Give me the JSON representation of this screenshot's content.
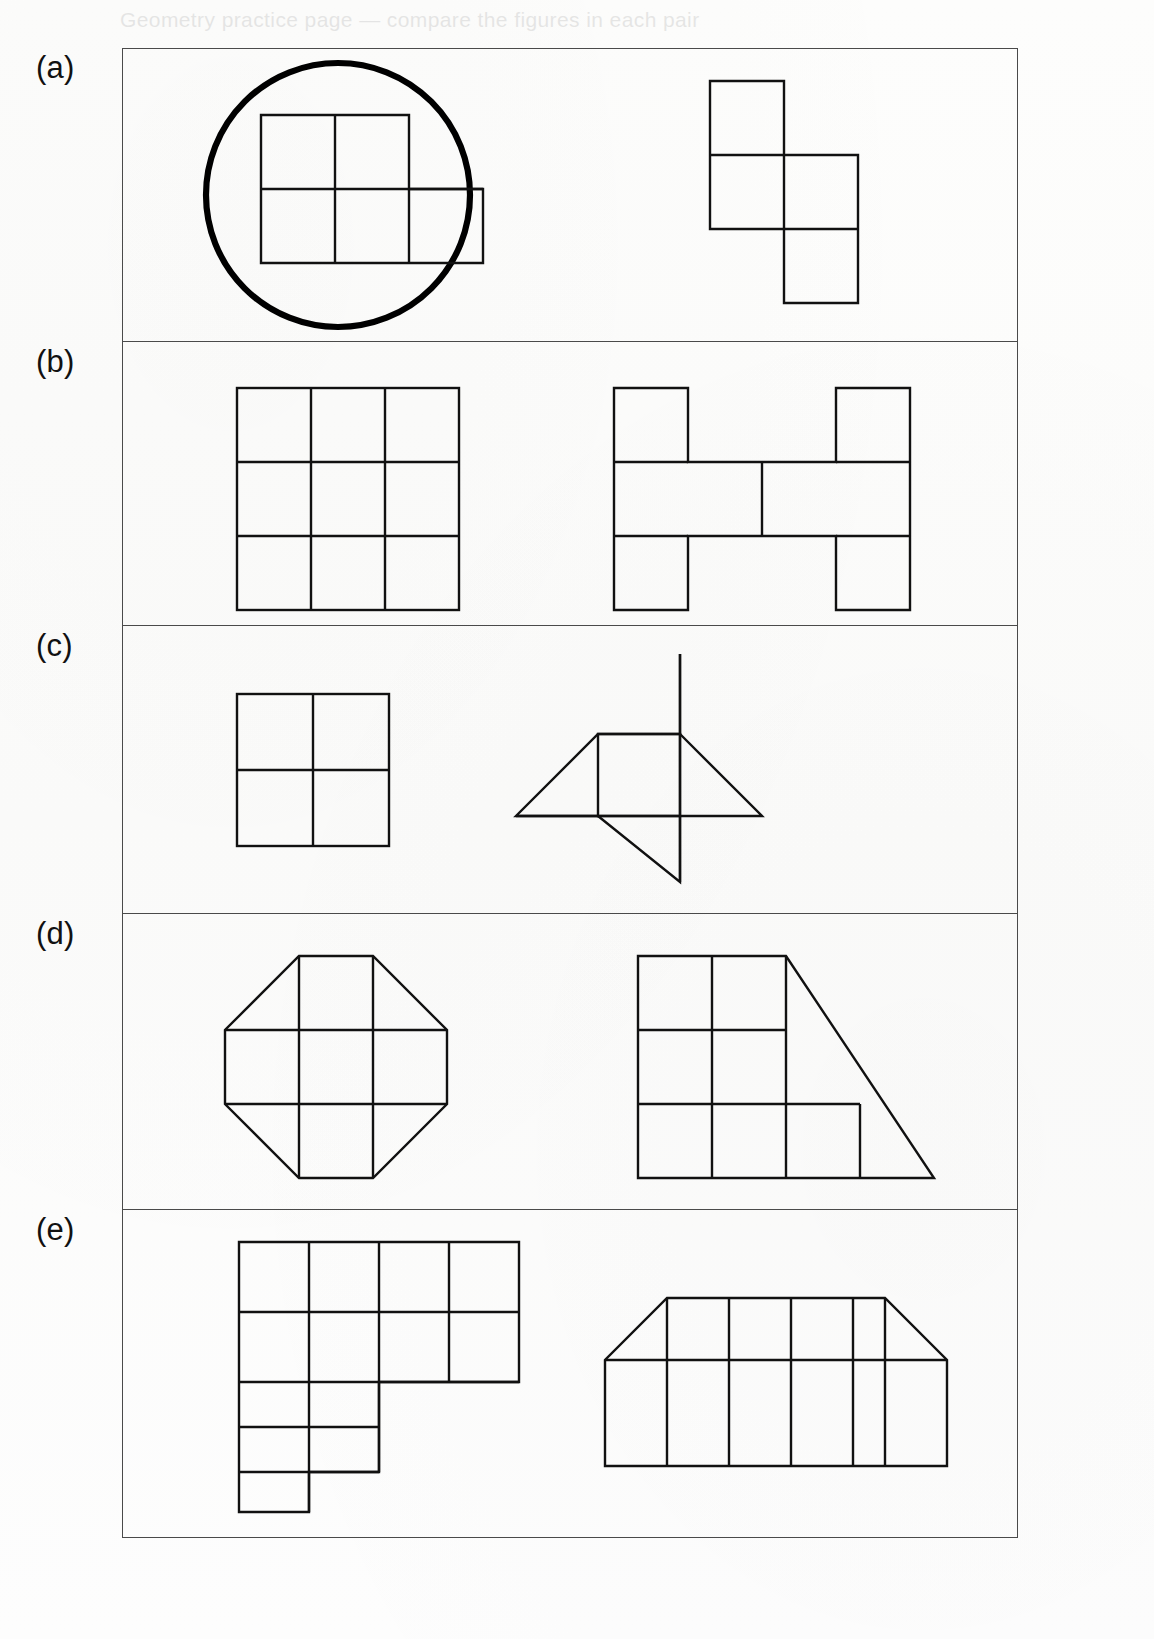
{
  "page": {
    "background_color": "#fefefe",
    "ink_color": "#111111",
    "frame_color": "#4a4a4a",
    "header_ghost_text": "Geometry practice page — compare the figures in each pair"
  },
  "figure": {
    "kind": "worksheet-figure",
    "rows": [
      {
        "id": "a",
        "label": "(a)",
        "left": {
          "name": "p-pentomino-circled",
          "description": "Five unit squares: a 2 by 2 block with one extra square to the right of the bottom row",
          "squares": [
            [
              0,
              0
            ],
            [
              1,
              0
            ],
            [
              0,
              1
            ],
            [
              1,
              1
            ],
            [
              2,
              1
            ]
          ],
          "annotation": "circle",
          "annotation_name": "selection-circle"
        },
        "right": {
          "name": "s-tetromino",
          "description": "Four unit squares in an S / Z arrangement",
          "squares": [
            [
              0,
              0
            ],
            [
              0,
              1
            ],
            [
              1,
              1
            ],
            [
              1,
              2
            ]
          ]
        }
      },
      {
        "id": "b",
        "label": "(b)",
        "left": {
          "name": "three-by-three-grid",
          "description": "Nine unit squares forming a 3 by 3 square",
          "squares": [
            [
              0,
              0
            ],
            [
              1,
              0
            ],
            [
              2,
              0
            ],
            [
              0,
              1
            ],
            [
              1,
              1
            ],
            [
              2,
              1
            ],
            [
              0,
              2
            ],
            [
              1,
              2
            ],
            [
              2,
              2
            ]
          ]
        },
        "right": {
          "name": "h-shape",
          "description": "Nine unit squares forming an H: two full columns joined by a middle row",
          "squares": [
            [
              0,
              0
            ],
            [
              3,
              0
            ],
            [
              0,
              1
            ],
            [
              1,
              1
            ],
            [
              2,
              1
            ],
            [
              3,
              1
            ],
            [
              0,
              2
            ],
            [
              3,
              2
            ]
          ]
        }
      },
      {
        "id": "c",
        "label": "(c)",
        "left": {
          "name": "two-by-two-grid",
          "description": "Four unit squares forming a 2 by 2 square",
          "squares": [
            [
              0,
              0
            ],
            [
              1,
              0
            ],
            [
              0,
              1
            ],
            [
              1,
              1
            ]
          ]
        },
        "right": {
          "name": "pinwheel-star",
          "description": "One central square with four right triangles attached, rotated like a pinwheel",
          "parts": [
            "center-square",
            "triangle-top",
            "triangle-right",
            "triangle-bottom",
            "triangle-left"
          ]
        }
      },
      {
        "id": "d",
        "label": "(d)",
        "left": {
          "name": "octagon-grid",
          "description": "A 3 by 3 grid of squares with the four corner squares cut diagonally, forming an octagon",
          "squares": 9,
          "cut_corners": 4
        },
        "right": {
          "name": "stepped-trapezoid",
          "description": "A staircase of squares with a diagonal on the right: two squares in the top row, three in the middle row, four in the bottom row plus two right triangles",
          "rows_of_squares": [
            2,
            3,
            4
          ]
        }
      },
      {
        "id": "e",
        "label": "(e)",
        "left": {
          "name": "staircase-polyomino",
          "description": "Four squares across the top row, four across the second row, two in the third row and two in a short fourth row",
          "rows_of_squares": [
            4,
            4,
            2,
            2
          ]
        },
        "right": {
          "name": "trapezoid-grid",
          "description": "Five unit squares in a row with a half square triangle at each end forming a trapezoid, split by a horizontal line near the top",
          "columns": 5,
          "end_triangles": 2
        }
      }
    ]
  }
}
